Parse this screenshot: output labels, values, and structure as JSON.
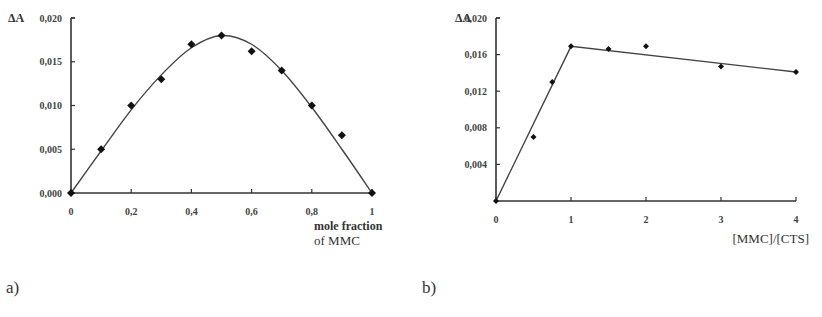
{
  "chart_data": [
    {
      "id": "a",
      "type": "scatter",
      "panel_label": "a)",
      "title": "",
      "ylabel": "ΔA",
      "xlabel_line1": "mole fraction",
      "xlabel_line2": "of MMC",
      "xlim": [
        0,
        1
      ],
      "ylim": [
        0,
        0.02
      ],
      "xticks": [
        "0",
        "0,2",
        "0,4",
        "0,6",
        "0,8",
        "1"
      ],
      "xtick_values": [
        0,
        0.2,
        0.4,
        0.6,
        0.8,
        1.0
      ],
      "yticks": [
        "0,000",
        "0,005",
        "0,010",
        "0,015",
        "0,020"
      ],
      "ytick_values": [
        0,
        0.005,
        0.01,
        0.015,
        0.02
      ],
      "grid": false,
      "series": [
        {
          "name": "measured",
          "marker": "diamond",
          "x": [
            0,
            0.1,
            0.2,
            0.3,
            0.4,
            0.5,
            0.6,
            0.7,
            0.8,
            0.9,
            1.0
          ],
          "y": [
            0.0,
            0.005,
            0.01,
            0.013,
            0.017,
            0.018,
            0.0162,
            0.014,
            0.01,
            0.0066,
            0.0
          ]
        },
        {
          "name": "fit curve",
          "style": "smooth line",
          "x": [
            0,
            0.1,
            0.2,
            0.3,
            0.4,
            0.5,
            0.6,
            0.7,
            0.8,
            0.9,
            1.0
          ],
          "y": [
            0.0,
            0.0048,
            0.0095,
            0.0135,
            0.0166,
            0.018,
            0.017,
            0.014,
            0.0098,
            0.005,
            0.0
          ]
        }
      ]
    },
    {
      "id": "b",
      "type": "scatter",
      "panel_label": "b)",
      "title": "",
      "ylabel": "ΔA",
      "xlabel": "[MMC]/[CTS]",
      "xlim": [
        0,
        4
      ],
      "ylim": [
        0,
        0.02
      ],
      "xticks": [
        "0",
        "1",
        "2",
        "3",
        "4"
      ],
      "xtick_values": [
        0,
        1,
        2,
        3,
        4
      ],
      "yticks": [
        "0,004",
        "0,008",
        "0,012",
        "0,016",
        "0,020"
      ],
      "ytick_values": [
        0.004,
        0.008,
        0.012,
        0.016,
        0.02
      ],
      "grid": false,
      "series": [
        {
          "name": "measured",
          "marker": "diamond",
          "x": [
            0,
            0.5,
            0.75,
            1.0,
            1.5,
            2.0,
            3.0,
            4.0
          ],
          "y": [
            0.0,
            0.007,
            0.013,
            0.0169,
            0.0166,
            0.0169,
            0.0147,
            0.0141
          ]
        },
        {
          "name": "fit lines",
          "style": "straight segments",
          "x": [
            0,
            1.0,
            4.0
          ],
          "y": [
            0.0,
            0.0169,
            0.0141
          ]
        }
      ]
    }
  ]
}
